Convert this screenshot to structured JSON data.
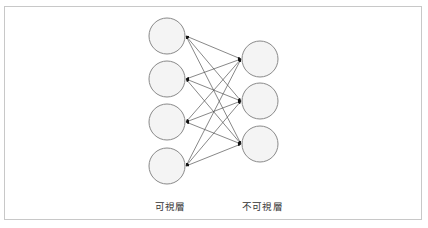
{
  "diagram": {
    "type": "restricted-boltzmann-machine",
    "colors": {
      "frame_border": "#c8c8c8",
      "node_fill": "#f4f4f4",
      "node_stroke": "#8a8a8a",
      "edge": "#555555",
      "arrowhead": "#111111",
      "label_text": "#333333"
    },
    "layers": {
      "visible": {
        "label": "可視層",
        "node_count": 4,
        "nodes": [
          {
            "id": "v1",
            "cx": 167,
            "cy": 36
          },
          {
            "id": "v2",
            "cx": 167,
            "cy": 79
          },
          {
            "id": "v3",
            "cx": 167,
            "cy": 122
          },
          {
            "id": "v4",
            "cx": 167,
            "cy": 166
          }
        ]
      },
      "hidden": {
        "label": "不可視層",
        "node_count": 3,
        "nodes": [
          {
            "id": "h1",
            "cx": 260,
            "cy": 59
          },
          {
            "id": "h2",
            "cx": 260,
            "cy": 101
          },
          {
            "id": "h3",
            "cx": 260,
            "cy": 144
          }
        ]
      }
    },
    "node_radius": 18,
    "edges": "fully-connected, bidirectional arrows between every visible and every hidden node"
  }
}
